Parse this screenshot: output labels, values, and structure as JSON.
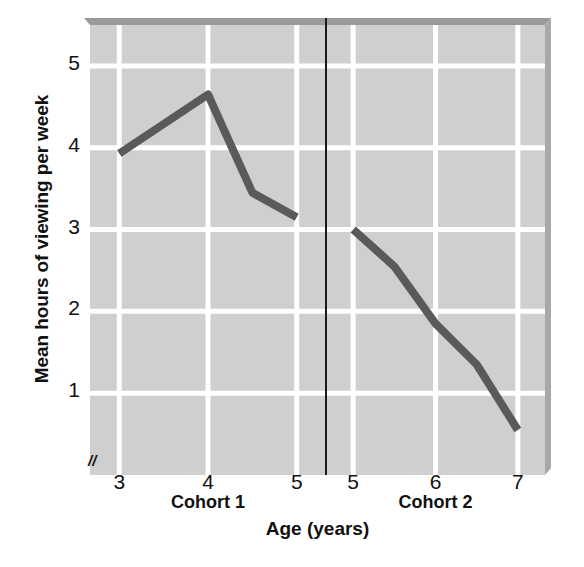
{
  "chart_data": {
    "type": "line",
    "title": "",
    "xlabel": "Age (years)",
    "ylabel": "Mean hours of viewing per week",
    "ylim": [
      0,
      5.5
    ],
    "yticks": [
      5,
      4,
      3,
      2,
      1
    ],
    "ytick_labels": [
      "5",
      "4",
      "3",
      "2",
      "1"
    ],
    "grid": true,
    "legend": "none",
    "axis_break_marker": "//",
    "panel_divider": true,
    "colors": {
      "line": "#5a5a5a",
      "plot_background": "#cfcfcf",
      "gridline": "#ffffff",
      "panel_edge": "#9a9a9a",
      "divider": "#1a1a1a",
      "text": "#111111"
    },
    "panels": [
      {
        "name": "Cohort 1",
        "label": "Cohort 1",
        "xticks": [
          3,
          4,
          5
        ],
        "xtick_labels": [
          "3",
          "4",
          "5"
        ],
        "x": [
          3,
          4,
          4.5,
          5
        ],
        "y": [
          3.93,
          4.65,
          3.45,
          3.15
        ]
      },
      {
        "name": "Cohort 2",
        "label": "Cohort 2",
        "xticks": [
          5,
          6,
          7
        ],
        "xtick_labels": [
          "5",
          "6",
          "7"
        ],
        "x": [
          5,
          5.5,
          6,
          6.5,
          7
        ],
        "y": [
          3.0,
          2.55,
          1.85,
          1.35,
          0.55
        ]
      }
    ]
  }
}
